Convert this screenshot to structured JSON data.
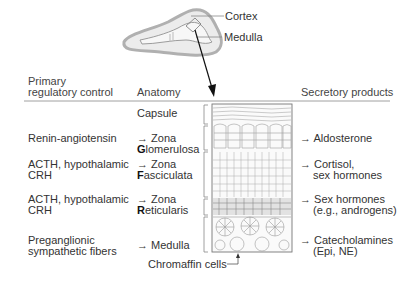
{
  "gland": {
    "labels": {
      "cortex": "Cortex",
      "medulla": "Medulla"
    }
  },
  "table": {
    "headers": {
      "control_line1": "Primary",
      "control_line2": "regulatory control",
      "anatomy": "Anatomy",
      "products": "Secretory products"
    },
    "capsule": "Capsule",
    "arrow": "→",
    "rows": [
      {
        "control": [
          "Renin-angiotensin"
        ],
        "anatomy_line1": "→ Zona",
        "anatomy_initial": "G",
        "anatomy_rest": "lomerulosa",
        "products": [
          "→ Aldosterone"
        ]
      },
      {
        "control": [
          "ACTH, hypothalamic",
          "CRH"
        ],
        "anatomy_line1": "→ Zona",
        "anatomy_initial": "F",
        "anatomy_rest": "asciculata",
        "products": [
          "→ Cortisol,",
          "sex hormones"
        ]
      },
      {
        "control": [
          "ACTH, hypothalamic",
          "CRH"
        ],
        "anatomy_line1": "→ Zona",
        "anatomy_initial": "R",
        "anatomy_rest": "eticularis",
        "products": [
          "→ Sex hormones",
          "(e.g., androgens)"
        ]
      },
      {
        "control": [
          "Preganglionic",
          "sympathetic fibers"
        ],
        "anatomy_line1": "→ Medulla",
        "products": [
          "→ Catecholamines",
          "(Epi, NE)"
        ]
      }
    ],
    "chromaffin_label": "Chromaffin cells"
  },
  "colors": {
    "text": "#333333",
    "line": "#888888",
    "tissue_stroke": "#9a9a9a",
    "gland_fill": "#e6e6e6",
    "gland_outline": "#b5b5b5"
  }
}
